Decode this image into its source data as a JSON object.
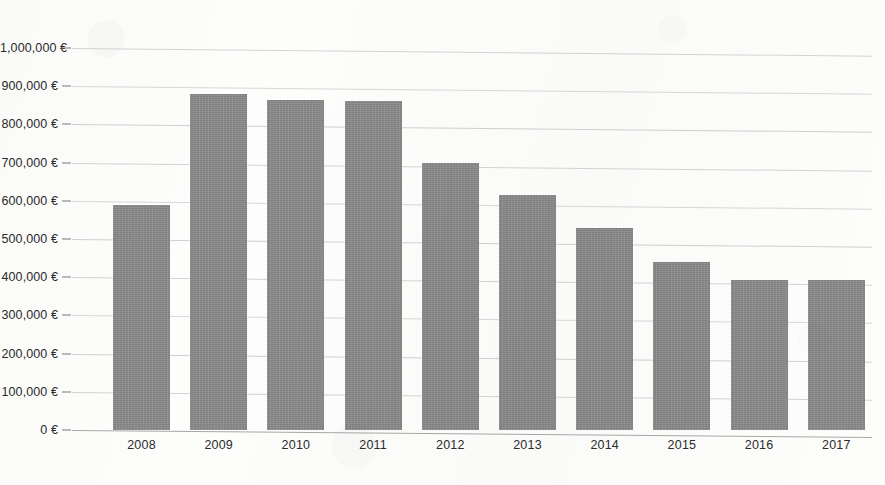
{
  "chart_data": {
    "type": "bar",
    "title": "",
    "xlabel": "",
    "ylabel": "",
    "categories": [
      "2008",
      "2009",
      "2010",
      "2011",
      "2012",
      "2013",
      "2014",
      "2015",
      "2016",
      "2017"
    ],
    "values": [
      590000,
      880000,
      865000,
      860000,
      698000,
      615000,
      530000,
      440000,
      393000,
      392000
    ],
    "ylim": [
      0,
      1000000
    ],
    "ytick_values": [
      0,
      100000,
      200000,
      300000,
      400000,
      500000,
      600000,
      700000,
      800000,
      900000,
      1000000
    ],
    "ytick_labels": [
      "0 €",
      "100,000 €",
      "200,000 €",
      "300,000 €",
      "400,000 €",
      "500,000 €",
      "600,000 €",
      "700,000 €",
      "800,000 €",
      "900,000 €",
      "1,000,000 €"
    ],
    "currency_symbol": "€",
    "grid": true,
    "grid_axis": "y",
    "legend": false,
    "legend_position": "none",
    "bar_color": "#8b8b8b",
    "gridline_color": "#b9b9b9",
    "text_color": "#2b2b2b",
    "background_color": "#fdfdfc"
  },
  "layout": {
    "plot_left": 72,
    "plot_right": 872,
    "baseline_y": 430,
    "top_y": 48,
    "bar_width": 57,
    "bar_pitch": 77.2,
    "first_bar_left": 113,
    "xlabel_y": 438
  }
}
